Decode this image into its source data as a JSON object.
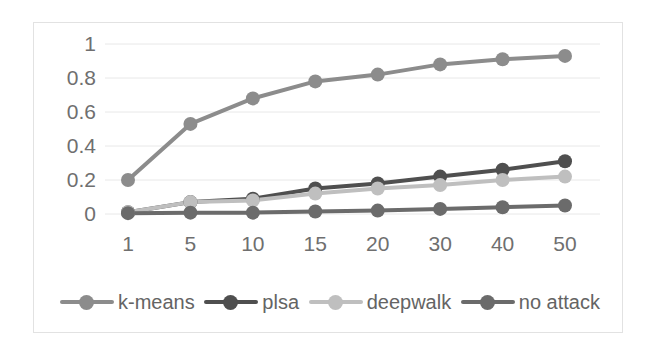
{
  "chart_data": {
    "type": "line",
    "title": "",
    "xlabel": "",
    "ylabel": "",
    "categories": [
      "1",
      "5",
      "10",
      "15",
      "20",
      "30",
      "40",
      "50"
    ],
    "x": [
      1,
      5,
      10,
      15,
      20,
      30,
      40,
      50
    ],
    "ylim": [
      0,
      1
    ],
    "xtick_labels": [
      "1",
      "5",
      "10",
      "15",
      "20",
      "30",
      "40",
      "50"
    ],
    "ytick_labels": [
      "1",
      "0.8",
      "0.6",
      "0.4",
      "0.2",
      "0"
    ],
    "ytick_values": [
      1,
      0.8,
      0.6,
      0.4,
      0.2,
      0
    ],
    "grid": true,
    "grid_axis": "y",
    "legend_position": "bottom",
    "markers": "circle",
    "series": [
      {
        "name": "k-means",
        "color": "#8c8c8c",
        "values": [
          0.2,
          0.53,
          0.68,
          0.78,
          0.82,
          0.88,
          0.91,
          0.93
        ]
      },
      {
        "name": "plsa",
        "color": "#4f4f4f",
        "values": [
          0.01,
          0.07,
          0.09,
          0.15,
          0.18,
          0.22,
          0.26,
          0.31
        ]
      },
      {
        "name": "deepwalk",
        "color": "#bfbfbf",
        "values": [
          0.01,
          0.07,
          0.08,
          0.12,
          0.15,
          0.17,
          0.2,
          0.22
        ]
      },
      {
        "name": "no attack",
        "color": "#6b6b6b",
        "values": [
          0.005,
          0.008,
          0.008,
          0.015,
          0.02,
          0.03,
          0.04,
          0.05
        ]
      }
    ]
  },
  "legend": {
    "items": [
      {
        "label": "k-means",
        "color": "#8c8c8c"
      },
      {
        "label": "plsa",
        "color": "#4f4f4f"
      },
      {
        "label": "deepwalk",
        "color": "#bfbfbf"
      },
      {
        "label": "no attack",
        "color": "#6b6b6b"
      }
    ]
  },
  "axes": {
    "y_labels": [
      "1",
      "0.8",
      "0.6",
      "0.4",
      "0.2",
      "0"
    ],
    "x_labels": [
      "1",
      "5",
      "10",
      "15",
      "20",
      "30",
      "40",
      "50"
    ]
  },
  "colors": {
    "grid": "#e8e8e8",
    "border": "#e2e2e2",
    "tick_text": "#6f6f6f",
    "legend_text": "#646464"
  }
}
